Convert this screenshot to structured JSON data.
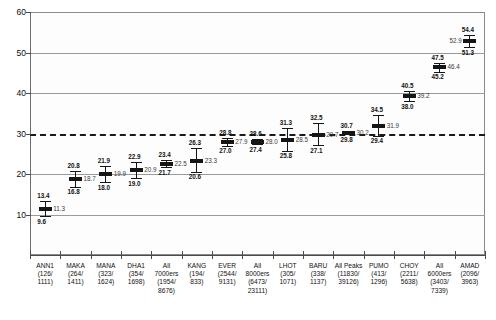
{
  "chart_data": {
    "type": "line",
    "title": "",
    "subtitle": "",
    "xlabel": "",
    "ylabel": "",
    "ylim": [
      0,
      60
    ],
    "y_ticks": [
      10,
      20,
      30,
      40,
      50,
      60
    ],
    "grid": true,
    "legend": "none",
    "reference_lines": [
      {
        "value": 20,
        "style": "solid"
      },
      {
        "value": 30,
        "style": "dashed"
      }
    ],
    "categories": [
      "ANN1\n(126/\n1111)",
      "MAKA\n(264/\n1411)",
      "MANA\n(323/\n1624)",
      "DHA1\n(354/\n1698)",
      "All\n7000ers\n(1954/\n8676)",
      "KANG\n(194/\n833)",
      "EVER\n(2544/\n9131)",
      "All\n8000ers\n(6473/\n23111)",
      "LHOT\n(305/\n1071)",
      "BARU\n(338/\n1137)",
      "All  Peaks\n(11830/\n39126)",
      "PUMO\n(413/\n1296)",
      "CHOY\n(2211/\n5638)",
      "All\n6000ers\n(3403/\n7339)",
      "AMAD\n(2096/\n3963)"
    ],
    "series": [
      {
        "name": "upper",
        "values": [
          13.4,
          20.8,
          21.9,
          22.9,
          23.4,
          26.3,
          28.8,
          28.6,
          31.3,
          32.5,
          30.7,
          34.5,
          40.5,
          47.5,
          54.4
        ]
      },
      {
        "name": "mean",
        "values": [
          11.3,
          18.7,
          19.9,
          20.9,
          22.5,
          23.3,
          27.9,
          28.0,
          28.5,
          29.7,
          30.2,
          31.9,
          39.2,
          46.4,
          52.9
        ]
      },
      {
        "name": "lower",
        "values": [
          9.6,
          16.8,
          18.0,
          19.0,
          21.7,
          20.6,
          27.0,
          27.4,
          25.8,
          27.1,
          29.8,
          29.4,
          38.0,
          45.2,
          51.3
        ]
      }
    ]
  }
}
